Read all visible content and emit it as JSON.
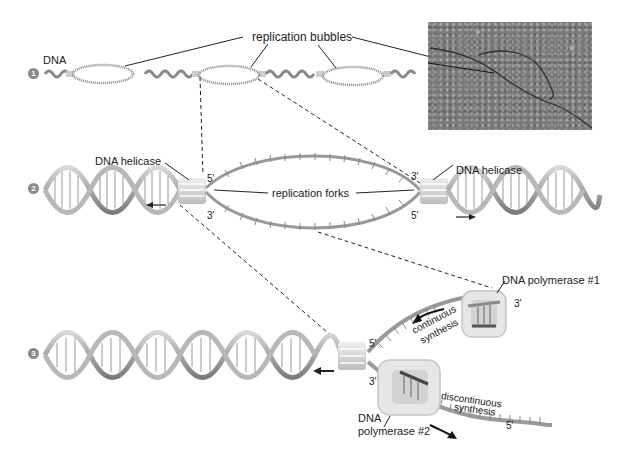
{
  "figure": {
    "steps": [
      {
        "number": "1",
        "description": "Replication bubbles along DNA"
      },
      {
        "number": "2",
        "description": "Replication forks with DNA helicase"
      },
      {
        "number": "3",
        "description": "Continuous and discontinuous synthesis"
      }
    ]
  },
  "panel1": {
    "step_label": "1",
    "dna_label": "DNA",
    "bubbles_label": "replication bubbles",
    "micrograph_alt": "electron micrograph of replication bubble"
  },
  "panel2": {
    "step_label": "2",
    "helicase_left_label": "DNA helicase",
    "helicase_right_label": "DNA helicase",
    "forks_label": "replication forks",
    "left_top_prime": "5′",
    "left_bottom_prime": "3′",
    "right_top_prime": "3′",
    "right_bottom_prime": "5′"
  },
  "panel3": {
    "step_label": "3",
    "polymerase1_label": "DNA polymerase #1",
    "polymerase2_label_line1": "DNA",
    "polymerase2_label_line2": "polymerase #2",
    "continuous_line1": "continuous",
    "continuous_line2": "synthesis",
    "discontinuous_line1": "discontinuous",
    "discontinuous_line2": "synthesis",
    "fork_top_prime": "5′",
    "fork_bottom_prime": "3′",
    "upper_strand_end_prime": "3′",
    "lower_strand_end_prime": "5′"
  },
  "colors": {
    "strand": "#9a9a9a",
    "strand_dark": "#6f6f6f",
    "helicase": "#d6d6d6",
    "polymerase": "#e2e2e2",
    "step_badge": "#8a8a8a",
    "micrograph": "#7a7a7a"
  }
}
